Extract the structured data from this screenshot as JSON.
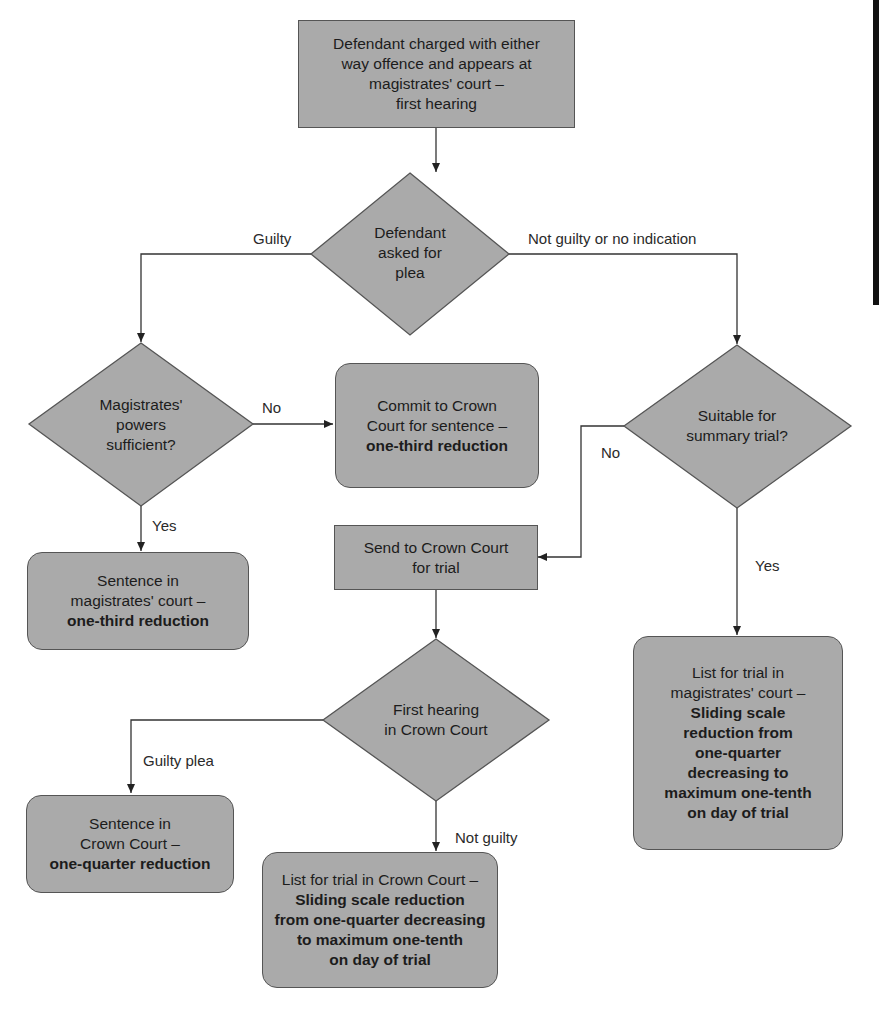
{
  "diagram": {
    "type": "flowchart",
    "colors": {
      "fill": "#aaaaaa",
      "stroke": "#555555",
      "line": "#333333",
      "text": "#1c1c1c"
    },
    "nodes": {
      "start": {
        "shape": "rectangle",
        "lines": [
          "Defendant charged with either",
          "way offence and appears at",
          "magistrates' court –",
          "first hearing"
        ]
      },
      "plea": {
        "shape": "diamond",
        "lines": [
          "Defendant",
          "asked for",
          "plea"
        ]
      },
      "powers": {
        "shape": "diamond",
        "lines": [
          "Magistrates'",
          "powers",
          "sufficient?"
        ]
      },
      "commit": {
        "shape": "rounded-rectangle",
        "lines": [
          "Commit to Crown",
          "Court for sentence –"
        ],
        "bold_lines": [
          "one-third reduction"
        ]
      },
      "sentence_mags": {
        "shape": "rounded-rectangle",
        "lines": [
          "Sentence in",
          "magistrates' court –"
        ],
        "bold_lines": [
          "one-third reduction"
        ]
      },
      "suitable": {
        "shape": "diamond",
        "lines": [
          "Suitable for",
          "summary trial?"
        ]
      },
      "send_crown": {
        "shape": "rectangle",
        "lines": [
          "Send to Crown Court",
          "for trial"
        ]
      },
      "first_hearing_crown": {
        "shape": "diamond",
        "lines": [
          "First hearing",
          "in Crown Court"
        ]
      },
      "list_mags": {
        "shape": "rounded-rectangle",
        "lines": [
          "List for trial in",
          "magistrates' court –"
        ],
        "bold_lines": [
          "Sliding scale",
          "reduction from",
          "one-quarter",
          "decreasing to",
          "maximum one-tenth",
          "on day of trial"
        ]
      },
      "sentence_crown": {
        "shape": "rounded-rectangle",
        "lines": [
          "Sentence in",
          "Crown Court –"
        ],
        "bold_lines": [
          "one-quarter reduction"
        ]
      },
      "list_crown": {
        "shape": "rounded-rectangle",
        "lines": [
          "List for trial in Crown Court –"
        ],
        "bold_lines": [
          "Sliding scale reduction",
          "from one-quarter decreasing",
          "to maximum one-tenth",
          "on day of trial"
        ]
      }
    },
    "edge_labels": {
      "guilty": "Guilty",
      "not_guilty_or_no_indication": "Not guilty or no indication",
      "powers_no": "No",
      "powers_yes": "Yes",
      "suitable_no": "No",
      "suitable_yes": "Yes",
      "guilty_plea": "Guilty plea",
      "not_guilty": "Not guilty"
    },
    "edges": [
      {
        "from": "start",
        "to": "plea"
      },
      {
        "from": "plea",
        "to": "powers",
        "label": "Guilty"
      },
      {
        "from": "plea",
        "to": "suitable",
        "label": "Not guilty or no indication"
      },
      {
        "from": "powers",
        "to": "commit",
        "label": "No"
      },
      {
        "from": "powers",
        "to": "sentence_mags",
        "label": "Yes"
      },
      {
        "from": "suitable",
        "to": "send_crown",
        "label": "No"
      },
      {
        "from": "suitable",
        "to": "list_mags",
        "label": "Yes"
      },
      {
        "from": "send_crown",
        "to": "first_hearing_crown"
      },
      {
        "from": "first_hearing_crown",
        "to": "sentence_crown",
        "label": "Guilty plea"
      },
      {
        "from": "first_hearing_crown",
        "to": "list_crown",
        "label": "Not guilty"
      }
    ]
  }
}
